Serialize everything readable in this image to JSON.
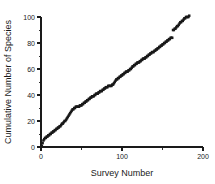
{
  "chart_data": {
    "type": "scatter",
    "title": "",
    "subtitle": "",
    "xlabel": "Survey Number",
    "ylabel": "Cumulative Number of Species",
    "xlim": [
      0,
      200
    ],
    "ylim": [
      0,
      100
    ],
    "grid": false,
    "legend": null,
    "marker_style": "filled-square",
    "marker_color": "#181818",
    "series_name": "Cumulative species accumulation",
    "x_ticks_major": [
      0,
      100,
      200
    ],
    "x_ticks_minor": [
      50,
      150
    ],
    "x_tick_labels": [
      "0",
      "100",
      "200"
    ],
    "y_ticks_major": [
      0,
      20,
      40,
      60,
      80,
      100
    ],
    "y_ticks_minor": [
      10,
      30,
      50,
      70,
      90
    ],
    "y_tick_labels": [
      "0",
      "20",
      "40",
      "60",
      "80",
      "100"
    ],
    "x": [
      1,
      2,
      3,
      4,
      5,
      6,
      7,
      8,
      9,
      10,
      11,
      12,
      13,
      14,
      15,
      16,
      17,
      18,
      19,
      20,
      21,
      22,
      23,
      24,
      25,
      26,
      27,
      28,
      29,
      30,
      31,
      32,
      33,
      34,
      35,
      36,
      37,
      38,
      39,
      40,
      41,
      42,
      43,
      44,
      45,
      46,
      47,
      48,
      49,
      50,
      51,
      52,
      53,
      54,
      55,
      56,
      57,
      58,
      59,
      60,
      61,
      62,
      63,
      64,
      65,
      66,
      67,
      68,
      69,
      70,
      71,
      72,
      73,
      74,
      75,
      76,
      77,
      78,
      79,
      80,
      81,
      82,
      83,
      84,
      85,
      86,
      87,
      88,
      89,
      90,
      91,
      92,
      93,
      94,
      95,
      96,
      97,
      98,
      99,
      100,
      101,
      102,
      103,
      104,
      105,
      106,
      107,
      108,
      109,
      110,
      111,
      112,
      113,
      114,
      115,
      116,
      117,
      118,
      119,
      120,
      121,
      122,
      123,
      124,
      125,
      126,
      127,
      128,
      129,
      130,
      131,
      132,
      133,
      134,
      135,
      136,
      137,
      138,
      139,
      140,
      141,
      142,
      143,
      144,
      145,
      146,
      147,
      148,
      149,
      150,
      151,
      152,
      153,
      154,
      155,
      156,
      157,
      158,
      159,
      160,
      161,
      162,
      163,
      164,
      165,
      166,
      167,
      168,
      169,
      170,
      171,
      172,
      173,
      174,
      175,
      176,
      177,
      178,
      179,
      180,
      181,
      182,
      183
    ],
    "y": [
      1,
      3,
      5,
      6,
      7,
      7,
      8,
      8,
      9,
      9,
      10,
      10,
      11,
      11,
      12,
      12,
      13,
      13,
      14,
      14,
      15,
      15,
      16,
      16,
      17,
      18,
      18,
      19,
      20,
      20,
      21,
      22,
      23,
      24,
      25,
      26,
      27,
      28,
      29,
      29,
      30,
      30,
      31,
      31,
      31,
      31,
      31,
      32,
      32,
      32,
      33,
      33,
      34,
      34,
      35,
      35,
      36,
      36,
      37,
      37,
      38,
      38,
      39,
      39,
      39,
      40,
      40,
      41,
      41,
      41,
      42,
      42,
      43,
      43,
      43,
      44,
      44,
      45,
      45,
      46,
      46,
      46,
      47,
      47,
      47,
      47,
      47,
      48,
      48,
      49,
      50,
      51,
      52,
      52,
      53,
      53,
      54,
      54,
      55,
      55,
      56,
      56,
      57,
      57,
      58,
      58,
      58,
      59,
      59,
      60,
      60,
      61,
      62,
      62,
      63,
      63,
      64,
      64,
      65,
      65,
      65,
      66,
      66,
      67,
      67,
      68,
      68,
      68,
      69,
      69,
      70,
      70,
      71,
      71,
      72,
      72,
      73,
      73,
      73,
      74,
      74,
      75,
      75,
      76,
      76,
      77,
      77,
      78,
      78,
      79,
      79,
      80,
      80,
      81,
      81,
      82,
      82,
      83,
      83,
      84,
      84,
      84,
      90,
      90,
      91,
      91,
      92,
      93,
      93,
      94,
      95,
      96,
      96,
      97,
      97,
      98,
      99,
      99,
      100,
      100,
      100,
      100,
      101,
      101,
      101
    ]
  },
  "axes": {
    "x_title": "Survey Number",
    "y_title": "Cumulative Number of Species"
  }
}
